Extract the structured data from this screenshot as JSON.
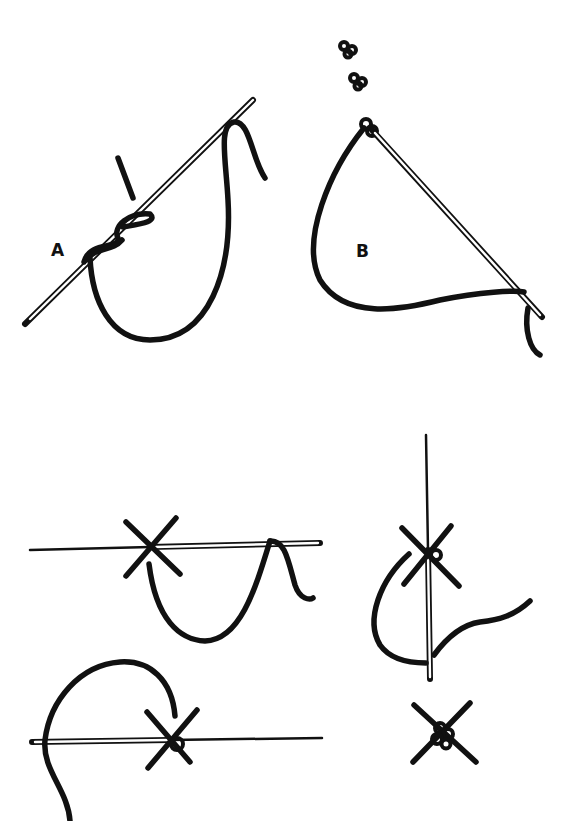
{
  "figure": {
    "panels": [
      {
        "id": "A",
        "label": "A",
        "description": "Thread wrapped twice around needle (French knot)"
      },
      {
        "id": "B",
        "label": "B",
        "description": "Needle pulled through to form knot; finished knots shown above"
      },
      {
        "id": "C",
        "label": "",
        "description": "Horizontal needle with cross stitch, thread looped below"
      },
      {
        "id": "D",
        "label": "",
        "description": "Vertical needle through cross stitch center"
      },
      {
        "id": "E",
        "label": "",
        "description": "Thread looped over needle at cross stitch"
      },
      {
        "id": "F",
        "label": "",
        "description": "Finished knotted cross stitch"
      }
    ]
  },
  "colors": {
    "ink": "#111111",
    "paper": "#ffffff"
  }
}
